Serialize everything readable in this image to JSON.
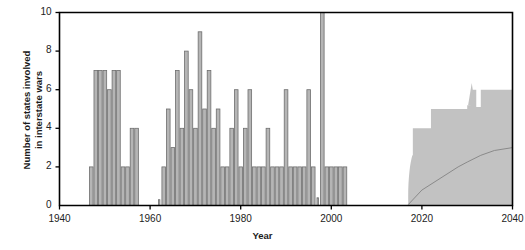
{
  "chart_data": {
    "type": "bar",
    "title": "",
    "xlabel": "Year",
    "ylabel": "Number of states involved in interstate wars",
    "ylabel_line1": "Number of states involved",
    "ylabel_line2": "in interstate wars",
    "xlim": [
      1940,
      2040
    ],
    "ylim": [
      0,
      10
    ],
    "xticks": [
      1940,
      1960,
      1980,
      2000,
      2020,
      2040
    ],
    "xtick_labels": [
      "1940",
      "1960",
      "1980",
      "2000",
      "2020",
      "2040"
    ],
    "yticks": [
      0,
      2,
      4,
      6,
      8,
      10
    ],
    "ytick_labels": [
      "0",
      "2",
      "4",
      "6",
      "8",
      "10"
    ],
    "grid": false,
    "legend": false,
    "bar_color": "#b5b5b5",
    "bar_edge_color": "#6e6e6e",
    "band_color": "#c2c2c2",
    "median_line_color": "#8a8a8a",
    "axis_color": "#000000",
    "x": [
      1947,
      1948,
      1949,
      1950,
      1951,
      1952,
      1953,
      1954,
      1955,
      1956,
      1957,
      1962,
      1963,
      1964,
      1965,
      1966,
      1967,
      1968,
      1969,
      1970,
      1971,
      1972,
      1973,
      1974,
      1975,
      1976,
      1977,
      1978,
      1979,
      1980,
      1981,
      1982,
      1983,
      1984,
      1985,
      1986,
      1987,
      1988,
      1989,
      1990,
      1991,
      1992,
      1993,
      1994,
      1995,
      1996,
      1997,
      1998,
      1999,
      2000,
      2001,
      2002,
      2003
    ],
    "values": [
      2,
      7,
      7,
      7,
      6,
      7,
      7,
      2,
      2,
      4,
      4,
      0.3,
      2,
      5,
      3,
      7,
      4,
      8,
      6,
      4,
      9,
      5,
      7,
      4,
      5,
      2,
      2,
      4,
      6,
      2,
      4,
      6,
      2,
      2,
      2,
      4,
      2,
      2,
      2,
      6,
      2,
      2,
      2,
      2,
      6,
      2,
      0.4,
      10,
      2,
      2,
      2,
      2,
      2
    ],
    "projection": {
      "label": "projection band",
      "start_year": 2017,
      "end_year": 2040,
      "upper_x": [
        2017,
        2018,
        2021,
        2022,
        2026,
        2027,
        2030,
        2031,
        2032,
        2033,
        2034,
        2035,
        2040
      ],
      "upper_y": [
        2.6,
        4.0,
        4.0,
        5.0,
        5.0,
        5.0,
        5.2,
        6.0,
        5.1,
        6.0,
        6.0,
        6.0,
        6.0
      ],
      "lower_x": [
        2017,
        2040
      ],
      "lower_y": [
        0,
        0
      ],
      "median_x": [
        2017,
        2020,
        2024,
        2028,
        2030,
        2033,
        2036,
        2040
      ],
      "median_y": [
        0.05,
        0.8,
        1.4,
        2.0,
        2.25,
        2.6,
        2.85,
        3.0
      ]
    }
  }
}
